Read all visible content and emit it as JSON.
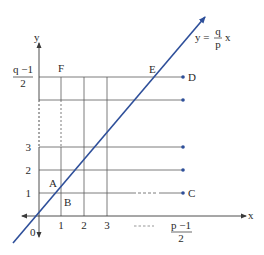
{
  "diagram": {
    "line_label": {
      "lhs": "y =",
      "num": "q",
      "den": "p",
      "var": "x"
    },
    "axis_labels": {
      "x": "x",
      "y": "y",
      "origin": "0"
    },
    "x_ticks": [
      "1",
      "2",
      "3"
    ],
    "x_end_label": {
      "num": "p −1",
      "den": "2"
    },
    "x_dashes": "- - - -",
    "y_ticks": [
      "1",
      "2",
      "3"
    ],
    "y_end_label": {
      "num": "q −1",
      "den": "2"
    },
    "points": {
      "A": "A",
      "B": "B",
      "C": "C",
      "D": "D",
      "E": "E",
      "F": "F"
    },
    "colors": {
      "line": "#2e4f9a",
      "grid": "#5a5a5a",
      "dot": "#2e4f9a"
    }
  }
}
